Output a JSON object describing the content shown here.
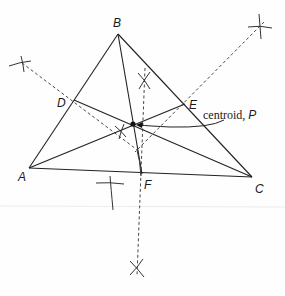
{
  "diagram": {
    "type": "geometric-construction",
    "colors": {
      "line": "#222222",
      "background": "#fefefe",
      "scan_line": "#e6e6e6"
    },
    "vertices": [
      {
        "id": "A",
        "label": "A",
        "x": 29,
        "y": 168
      },
      {
        "id": "B",
        "label": "B",
        "x": 118,
        "y": 34
      },
      {
        "id": "C",
        "label": "C",
        "x": 252,
        "y": 177
      }
    ],
    "midpoints": [
      {
        "id": "D",
        "label": "D",
        "x": 74,
        "y": 100,
        "on_side": "AB"
      },
      {
        "id": "E",
        "label": "E",
        "x": 185,
        "y": 104,
        "on_side": "BC"
      },
      {
        "id": "F",
        "label": "F",
        "x": 142,
        "y": 174,
        "on_side": "AC"
      }
    ],
    "centroid": {
      "id": "P",
      "x": 133,
      "y": 124,
      "label_text": "centroid, ",
      "label_var": "P"
    },
    "medians": [
      "A-E",
      "B-F",
      "C-D"
    ],
    "perpendicular_bisectors": [
      {
        "side": "AB",
        "from": {
          "x": 22,
          "y": 63
        },
        "to": {
          "x": 137,
          "y": 149
        }
      },
      {
        "side": "BC",
        "from": {
          "x": 262,
          "y": 24
        },
        "to": {
          "x": 137,
          "y": 149
        }
      },
      {
        "side": "AC",
        "from": {
          "x": 144,
          "y": 79
        },
        "to": {
          "x": 137,
          "y": 268
        }
      }
    ],
    "arc_marks": [
      {
        "x": 22,
        "y": 63
      },
      {
        "x": 260,
        "y": 26
      },
      {
        "x": 144,
        "y": 79
      },
      {
        "x": 121,
        "y": 131
      },
      {
        "x": 137,
        "y": 268
      },
      {
        "x": 110,
        "y": 182
      }
    ]
  }
}
